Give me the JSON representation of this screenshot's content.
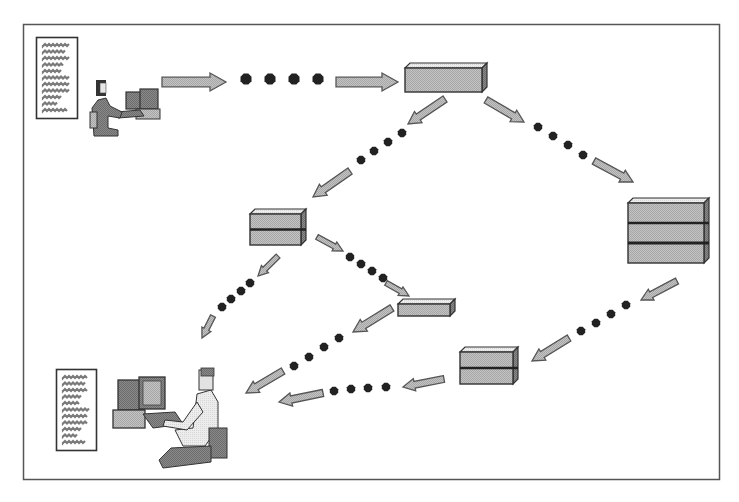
{
  "diagram": {
    "title": "",
    "type": "network data flow",
    "colors": {
      "background": "#ffffff",
      "frame": "#555555",
      "box_fill": "#bdbdbd",
      "box_top": "#d4d4d4",
      "box_side": "#a8a8a8",
      "box_stroke": "#333333",
      "arrow_fill": "#b0b0b0",
      "arrow_stroke": "#555555",
      "packet_dot": "#222222",
      "doc_text": "#7a7a7a"
    },
    "frame": {
      "x": 23,
      "y": 24,
      "w": 697,
      "h": 456
    },
    "nodes": [
      {
        "id": "sender-document",
        "kind": "document",
        "x": 36,
        "y": 37,
        "w": 41,
        "h": 81,
        "lines": 11
      },
      {
        "id": "sender-user",
        "kind": "person-woman-at-computer",
        "x": 90,
        "y": 78,
        "w": 72,
        "h": 58
      },
      {
        "id": "router-top",
        "kind": "server",
        "x": 405,
        "y": 63,
        "w": 82,
        "h": 29,
        "layers": 1
      },
      {
        "id": "router-mid-left",
        "kind": "server",
        "x": 250,
        "y": 209,
        "w": 56,
        "h": 36,
        "layers": 2
      },
      {
        "id": "router-right",
        "kind": "server",
        "x": 628,
        "y": 198,
        "w": 81,
        "h": 65,
        "layers": 3
      },
      {
        "id": "router-thin",
        "kind": "server",
        "x": 398,
        "y": 299,
        "w": 57,
        "h": 17,
        "layers": 1
      },
      {
        "id": "router-lower",
        "kind": "server",
        "x": 460,
        "y": 347,
        "w": 58,
        "h": 37,
        "layers": 2
      },
      {
        "id": "receiver-document",
        "kind": "document",
        "x": 56,
        "y": 369,
        "w": 40,
        "h": 81,
        "lines": 11
      },
      {
        "id": "receiver-user",
        "kind": "person-man-at-computer",
        "x": 113,
        "y": 368,
        "w": 115,
        "h": 100
      }
    ],
    "paths": [
      {
        "id": "sender-to-top",
        "arrows": [
          [
            162,
            82,
            226,
            82
          ],
          [
            336,
            82,
            398,
            82
          ]
        ],
        "dots": [
          [
            246,
            79
          ],
          [
            270,
            79
          ],
          [
            294,
            79
          ],
          [
            318,
            79
          ]
        ]
      },
      {
        "id": "top-to-mid-left",
        "arrows": [
          [
            445,
            99,
            408,
            124
          ],
          [
            350,
            171,
            313,
            197
          ]
        ],
        "dots": [
          [
            402,
            133
          ],
          [
            388,
            142
          ],
          [
            374,
            151
          ],
          [
            361,
            160
          ]
        ]
      },
      {
        "id": "top-to-right",
        "arrows": [
          [
            486,
            100,
            524,
            122
          ],
          [
            594,
            161,
            633,
            182
          ]
        ],
        "dots": [
          [
            538,
            127
          ],
          [
            553,
            136
          ],
          [
            568,
            145
          ],
          [
            583,
            155
          ]
        ]
      },
      {
        "id": "mid-left-to-receiver",
        "arrows": [
          [
            278,
            256,
            258,
            276
          ],
          [
            213,
            316,
            202,
            338
          ]
        ],
        "dots": [
          [
            250,
            283
          ],
          [
            241,
            291
          ],
          [
            231,
            299
          ],
          [
            222,
            307
          ]
        ]
      },
      {
        "id": "mid-left-to-thin",
        "arrows": [
          [
            317,
            237,
            343,
            251
          ],
          [
            386,
            283,
            409,
            296
          ]
        ],
        "dots": [
          [
            350,
            257
          ],
          [
            361,
            264
          ],
          [
            372,
            271
          ],
          [
            383,
            278
          ]
        ]
      },
      {
        "id": "thin-to-receiver",
        "arrows": [
          [
            392,
            308,
            353,
            332
          ],
          [
            283,
            371,
            246,
            393
          ]
        ],
        "dots": [
          [
            339,
            338
          ],
          [
            324,
            347
          ],
          [
            309,
            357
          ],
          [
            294,
            366
          ]
        ]
      },
      {
        "id": "right-to-lower",
        "arrows": [
          [
            677,
            281,
            641,
            300
          ],
          [
            569,
            338,
            532,
            361
          ]
        ],
        "dots": [
          [
            626,
            305
          ],
          [
            611,
            314
          ],
          [
            596,
            323
          ],
          [
            581,
            331
          ]
        ]
      },
      {
        "id": "lower-to-receiver",
        "arrows": [
          [
            444,
            379,
            403,
            387
          ],
          [
            323,
            393,
            279,
            402
          ]
        ],
        "dots": [
          [
            386,
            387
          ],
          [
            368,
            388
          ],
          [
            351,
            389
          ],
          [
            334,
            391
          ]
        ]
      }
    ]
  }
}
